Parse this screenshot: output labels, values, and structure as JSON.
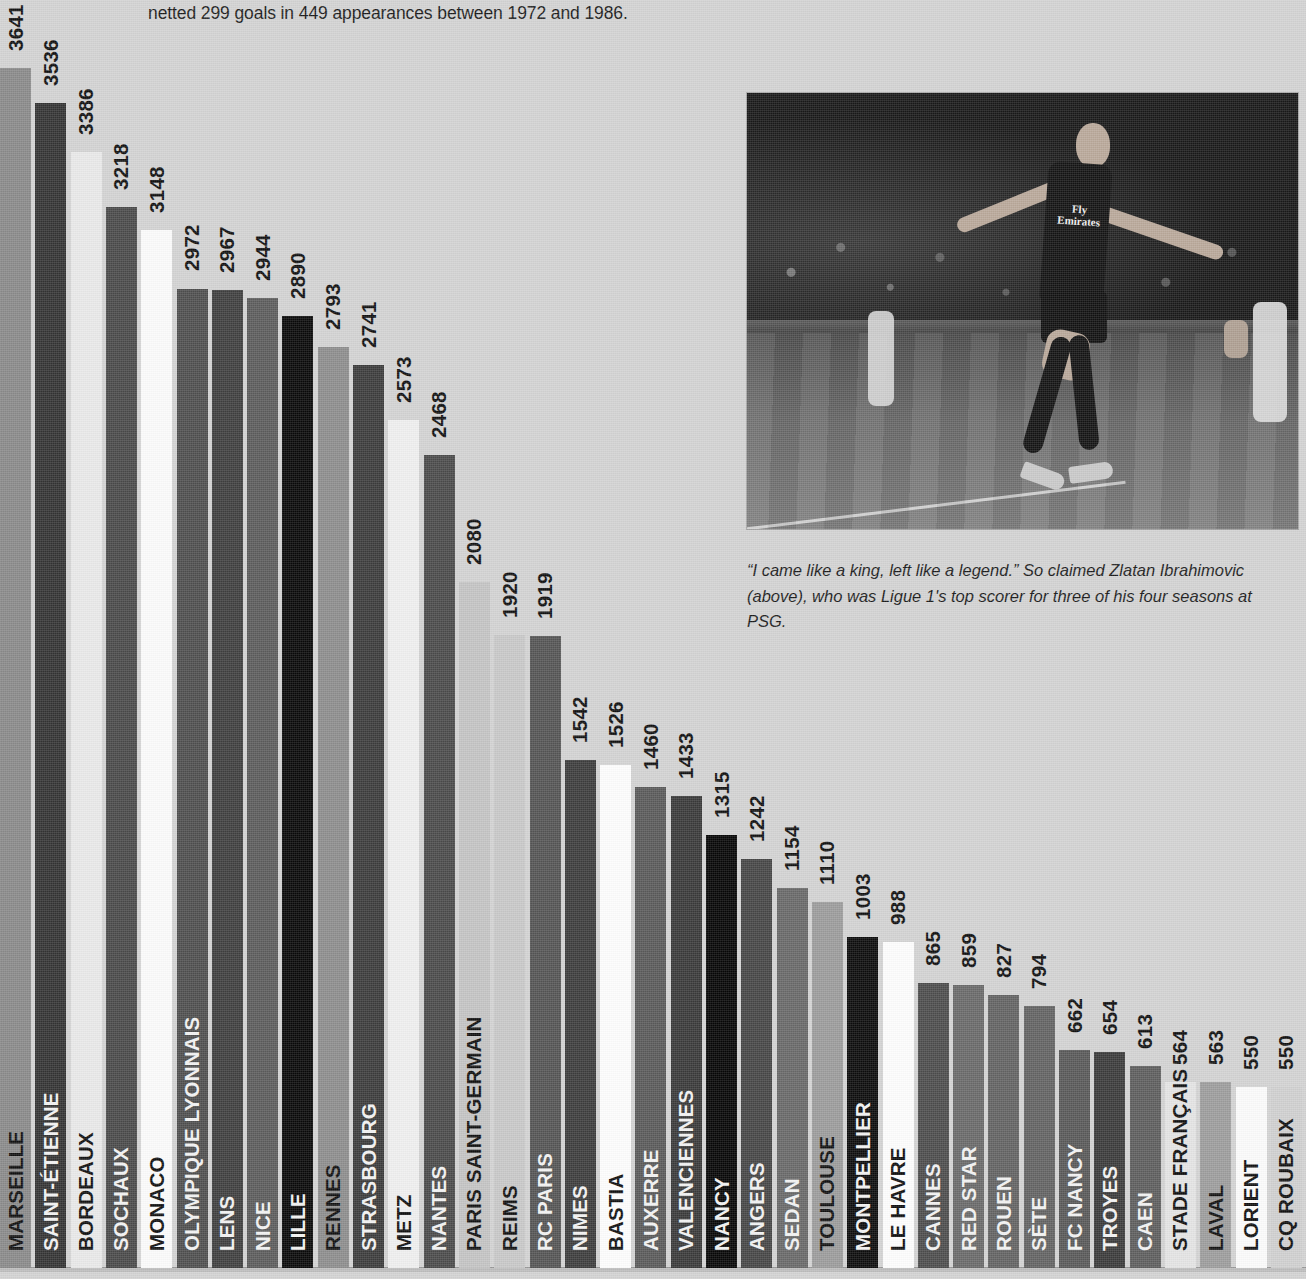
{
  "headline": "netted 299 goals in 449 appearances between 1972 and 1986.",
  "caption": "“I came like a king, left like a legend.” So claimed Zlatan Ibrahimovic (above), who was Ligue 1's top scorer for three of his four seasons at PSG.",
  "photo": {
    "alt_name": "zlatan-ibrahimovic-celebration-photo",
    "shirt_text_line1": "Fly",
    "shirt_text_line2": "Emirates"
  },
  "chart_data": {
    "type": "bar",
    "title": "",
    "xlabel": "",
    "ylabel": "",
    "ylim": [
      0,
      3641
    ],
    "grid": false,
    "legend": false,
    "categories": [
      "MARSEILLE",
      "SAINT-ÉTIENNE",
      "BORDEAUX",
      "SOCHAUX",
      "MONACO",
      "OLYMPIQUE LYONNAIS",
      "LENS",
      "NICE",
      "LILLE",
      "RENNES",
      "STRASBOURG",
      "METZ",
      "NANTES",
      "PARIS SAINT-GERMAIN",
      "REIMS",
      "RC PARIS",
      "NIMES",
      "BASTIA",
      "AUXERRE",
      "VALENCIENNES",
      "NANCY",
      "ANGERS",
      "SEDAN",
      "TOULOUSE",
      "MONTPELLIER",
      "LE HAVRE",
      "CANNES",
      "RED STAR",
      "ROUEN",
      "SÈTE",
      "FC NANCY",
      "TROYES",
      "CAEN",
      "STADE FRANÇAIS",
      "LAVAL",
      "LORIENT",
      "CQ ROUBAIX"
    ],
    "values": [
      3641,
      3536,
      3386,
      3218,
      3148,
      2972,
      2967,
      2944,
      2890,
      2793,
      2741,
      2573,
      2468,
      2080,
      1920,
      1919,
      1542,
      1526,
      1460,
      1433,
      1315,
      1242,
      1154,
      1110,
      1003,
      988,
      865,
      859,
      827,
      794,
      662,
      654,
      613,
      564,
      563,
      550,
      550
    ],
    "bars": [
      {
        "label": "MARSEILLE",
        "value": 3641,
        "color": "#8a8a8a",
        "label_color": "#111"
      },
      {
        "label": "SAINT-ÉTIENNE",
        "value": 3536,
        "color": "#343434",
        "label_color": "#111"
      },
      {
        "label": "BORDEAUX",
        "value": 3386,
        "color": "#e9e9e9",
        "label_color": "#111"
      },
      {
        "label": "SOCHAUX",
        "value": 3218,
        "color": "#4a4a4a",
        "label_color": "#111"
      },
      {
        "label": "MONACO",
        "value": 3148,
        "color": "#fbfbfb",
        "label_color": "#111"
      },
      {
        "label": "OLYMPIQUE LYONNAIS",
        "value": 2972,
        "color": "#4f4f4f",
        "label_color": "#111"
      },
      {
        "label": "LENS",
        "value": 2967,
        "color": "#3f3f3f",
        "label_color": "#111"
      },
      {
        "label": "NICE",
        "value": 2944,
        "color": "#5c5c5c",
        "label_color": "#111"
      },
      {
        "label": "LILLE",
        "value": 2890,
        "color": "#0a0a0a",
        "label_color": "#111"
      },
      {
        "label": "RENNES",
        "value": 2793,
        "color": "#8d8d8d",
        "label_color": "#111"
      },
      {
        "label": "STRASBOURG",
        "value": 2741,
        "color": "#3c3c3c",
        "label_color": "#111"
      },
      {
        "label": "METZ",
        "value": 2573,
        "color": "#efefef",
        "label_color": "#111"
      },
      {
        "label": "NANTES",
        "value": 2468,
        "color": "#4b4b4b",
        "label_color": "#111"
      },
      {
        "label": "PARIS SAINT-GERMAIN",
        "value": 2080,
        "color": "#c4c4c4",
        "label_color": "#111"
      },
      {
        "label": "REIMS",
        "value": 1920,
        "color": "#c8c8c8",
        "label_color": "#111"
      },
      {
        "label": "RC PARIS",
        "value": 1919,
        "color": "#555555",
        "label_color": "#111"
      },
      {
        "label": "NIMES",
        "value": 1542,
        "color": "#3d3d3d",
        "label_color": "#111"
      },
      {
        "label": "BASTIA",
        "value": 1526,
        "color": "#fdfdfd",
        "label_color": "#111"
      },
      {
        "label": "AUXERRE",
        "value": 1460,
        "color": "#5a5a5a",
        "label_color": "#111"
      },
      {
        "label": "VALENCIENNES",
        "value": 1433,
        "color": "#3a3a3a",
        "label_color": "#111"
      },
      {
        "label": "NANCY",
        "value": 1315,
        "color": "#070707",
        "label_color": "#111"
      },
      {
        "label": "ANGERS",
        "value": 1242,
        "color": "#464646",
        "label_color": "#111"
      },
      {
        "label": "SEDAN",
        "value": 1154,
        "color": "#696969",
        "label_color": "#111"
      },
      {
        "label": "TOULOUSE",
        "value": 1110,
        "color": "#9c9c9c",
        "label_color": "#111"
      },
      {
        "label": "MONTPELLIER",
        "value": 1003,
        "color": "#0d0d0d",
        "label_color": "#111"
      },
      {
        "label": "LE HAVRE",
        "value": 988,
        "color": "#fdfdfd",
        "label_color": "#111"
      },
      {
        "label": "CANNES",
        "value": 865,
        "color": "#4d4d4d",
        "label_color": "#111"
      },
      {
        "label": "RED STAR",
        "value": 859,
        "color": "#6a6a6a",
        "label_color": "#111"
      },
      {
        "label": "ROUEN",
        "value": 827,
        "color": "#636363",
        "label_color": "#111"
      },
      {
        "label": "SÈTE",
        "value": 794,
        "color": "#636363",
        "label_color": "#111"
      },
      {
        "label": "FC NANCY",
        "value": 662,
        "color": "#595959",
        "label_color": "#111"
      },
      {
        "label": "TROYES",
        "value": 654,
        "color": "#3b3b3b",
        "label_color": "#111"
      },
      {
        "label": "CAEN",
        "value": 613,
        "color": "#5e5e5e",
        "label_color": "#111"
      },
      {
        "label": "STADE FRANÇAIS",
        "value": 564,
        "color": "#e4e4e4",
        "label_color": "#111"
      },
      {
        "label": "LAVAL",
        "value": 563,
        "color": "#9d9d9d",
        "label_color": "#111"
      },
      {
        "label": "LORIENT",
        "value": 550,
        "color": "#fbfbfb",
        "label_color": "#111"
      },
      {
        "label": "CQ ROUBAIX",
        "value": 550,
        "color": "#d0d0d0",
        "label_color": "#111"
      }
    ]
  }
}
